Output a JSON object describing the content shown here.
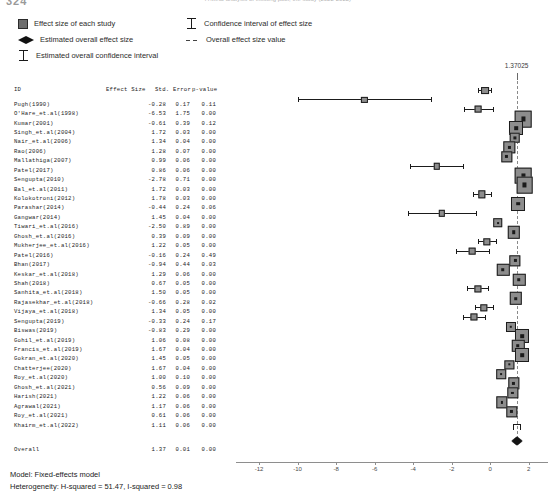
{
  "header": {
    "crop_left": "324",
    "crop_right": "A Meta-analysis of existing pool, the study (2022-2022)"
  },
  "legend": {
    "items_left": [
      {
        "glyph": "gray-square-icon",
        "label": "Effect size of each study"
      },
      {
        "glyph": "black-diamond-icon",
        "label": "Estimated overall effect size"
      },
      {
        "glyph": "error-bar-icon",
        "label": "Estimated overall confidence interval"
      }
    ],
    "items_right": [
      {
        "glyph": "error-bar-icon",
        "label": "Confidence interval of effect size"
      },
      {
        "glyph": "dashed-line-icon",
        "label": "Overall effect size value"
      }
    ]
  },
  "table": {
    "columns": [
      "ID",
      "Effect Size",
      "Std. Error",
      "p-value"
    ],
    "rows": [
      {
        "id": "Pugh(1990)",
        "es": "-0.28",
        "se": "0.17",
        "pv": "0.11"
      },
      {
        "id": "O'Hare_et.al(1998)",
        "es": "-6.53",
        "se": "1.75",
        "pv": "0.00"
      },
      {
        "id": "Kumar(2001)",
        "es": "-0.61",
        "se": "0.39",
        "pv": "0.12"
      },
      {
        "id": "Singh_et.al(2004)",
        "es": "1.72",
        "se": "0.03",
        "pv": "0.00"
      },
      {
        "id": "Nair_et.al(2006)",
        "es": "1.34",
        "se": "0.04",
        "pv": "0.00"
      },
      {
        "id": "Rao(2006)",
        "es": "1.28",
        "se": "0.07",
        "pv": "0.00"
      },
      {
        "id": "Mallathiga(2007)",
        "es": "0.99",
        "se": "0.06",
        "pv": "0.00"
      },
      {
        "id": "Patel(2017)",
        "es": "0.86",
        "se": "0.06",
        "pv": "0.00"
      },
      {
        "id": "Sengupta(2010)",
        "es": "-2.78",
        "se": "0.71",
        "pv": "0.00"
      },
      {
        "id": "Bal_et.al(2011)",
        "es": "1.72",
        "se": "0.03",
        "pv": "0.00"
      },
      {
        "id": "Kolokotroni(2012)",
        "es": "1.78",
        "se": "0.03",
        "pv": "0.00"
      },
      {
        "id": "Parashar(2014)",
        "es": "-0.44",
        "se": "0.24",
        "pv": "0.06"
      },
      {
        "id": "Gangwar(2014)",
        "es": "1.45",
        "se": "0.04",
        "pv": "0.00"
      },
      {
        "id": "Tiwari_et.al(2016)",
        "es": "-2.50",
        "se": "0.89",
        "pv": "0.00"
      },
      {
        "id": "Ghosh_et.al(2016)",
        "es": "0.39",
        "se": "0.09",
        "pv": "0.00"
      },
      {
        "id": "Mukherjee_et.al(2016)",
        "es": "1.22",
        "se": "0.05",
        "pv": "0.00"
      },
      {
        "id": "Patel(2016)",
        "es": "-0.16",
        "se": "0.24",
        "pv": "0.49"
      },
      {
        "id": "Bhan(2017)",
        "es": "-0.94",
        "se": "0.44",
        "pv": "0.03"
      },
      {
        "id": "Keskar_et.al(2018)",
        "es": "1.29",
        "se": "0.06",
        "pv": "0.00"
      },
      {
        "id": "Shah(2018)",
        "es": "0.67",
        "se": "0.05",
        "pv": "0.00"
      },
      {
        "id": "Sanhita_et.al(2018)",
        "es": "1.50",
        "se": "0.05",
        "pv": "0.00"
      },
      {
        "id": "Rajasekhar_et.al(2018)",
        "es": "-0.66",
        "se": "0.28",
        "pv": "0.02"
      },
      {
        "id": "Vijaya_et.al(2018)",
        "es": "1.34",
        "se": "0.05",
        "pv": "0.00"
      },
      {
        "id": "Sengupta(2019)",
        "es": "-0.33",
        "se": "0.24",
        "pv": "0.17"
      },
      {
        "id": "Biswas(2019)",
        "es": "-0.83",
        "se": "0.29",
        "pv": "0.00"
      },
      {
        "id": "Gohil_et.al(2019)",
        "es": "1.06",
        "se": "0.08",
        "pv": "0.00"
      },
      {
        "id": "Francis_et.al(2019)",
        "es": "1.67",
        "se": "0.04",
        "pv": "0.00"
      },
      {
        "id": "Gokran_et.al(2020)",
        "es": "1.45",
        "se": "0.05",
        "pv": "0.00"
      },
      {
        "id": "Chatterjee(2020)",
        "es": "1.67",
        "se": "0.04",
        "pv": "0.00"
      },
      {
        "id": "Roy_et.al(2020)",
        "es": "1.00",
        "se": "0.10",
        "pv": "0.00"
      },
      {
        "id": "Ghosh_et.al(2021)",
        "es": "0.56",
        "se": "0.09",
        "pv": "0.00"
      },
      {
        "id": "Harish(2021)",
        "es": "1.22",
        "se": "0.06",
        "pv": "0.00"
      },
      {
        "id": "Agrawal(2021)",
        "es": "1.17",
        "se": "0.06",
        "pv": "0.00"
      },
      {
        "id": "Roy_et.al(2021)",
        "es": "0.61",
        "se": "0.06",
        "pv": "0.00"
      },
      {
        "id": "Khairm_et.al(2022)",
        "es": "1.11",
        "se": "0.06",
        "pv": "0.00"
      }
    ],
    "overall": {
      "id": "Overall",
      "es": "1.37",
      "se": "0.01",
      "pv": "0.00"
    }
  },
  "plot": {
    "annotation": "1.37025",
    "axis": {
      "ticks": [
        -12,
        -10,
        -8,
        -6,
        -4,
        -2,
        0,
        2
      ],
      "tick_labels": [
        "-12",
        "-10",
        "-8",
        "-6",
        "-4",
        "-2",
        "0",
        "2"
      ],
      "min": -13.2,
      "max": 3.0
    },
    "ref_line_value": 1.37025,
    "colors": {
      "marker_fill": "#8d8d8d",
      "marker_edge": "#1c1c1c",
      "ci_line": "#1b1b1b",
      "ref_line": "#8a8a8a",
      "axis": "#8e8e8e"
    }
  },
  "chart_data": {
    "type": "forest",
    "title": "",
    "xlabel": "",
    "ylabel": "",
    "xlim": [
      -13.2,
      3.0
    ],
    "grid": false,
    "legend_position": "top",
    "ref_line": 1.37025,
    "model": "Fixed-effects model",
    "heterogeneity": {
      "H_squared": 51.47,
      "I_squared": 0.98
    },
    "categories": [
      "Pugh(1990)",
      "O'Hare_et.al(1998)",
      "Kumar(2001)",
      "Singh_et.al(2004)",
      "Nair_et.al(2006)",
      "Rao(2006)",
      "Mallathiga(2007)",
      "Patel(2017)",
      "Sengupta(2010)",
      "Bal_et.al(2011)",
      "Kolokotroni(2012)",
      "Parashar(2014)",
      "Gangwar(2014)",
      "Tiwari_et.al(2016)",
      "Ghosh_et.al(2016)",
      "Mukherjee_et.al(2016)",
      "Patel(2016)",
      "Bhan(2017)",
      "Keskar_et.al(2018)",
      "Shah(2018)",
      "Sanhita_et.al(2018)",
      "Rajasekhar_et.al(2018)",
      "Vijaya_et.al(2018)",
      "Sengupta(2019)",
      "Biswas(2019)",
      "Gohil_et.al(2019)",
      "Francis_et.al(2019)",
      "Gokran_et.al(2020)",
      "Chatterjee(2020)",
      "Roy_et.al(2020)",
      "Ghosh_et.al(2021)",
      "Harish(2021)",
      "Agrawal(2021)",
      "Roy_et.al(2021)",
      "Khairm_et.al(2022)",
      "Overall"
    ],
    "effect_sizes": [
      -0.28,
      -6.53,
      -0.61,
      1.72,
      1.34,
      1.28,
      0.99,
      0.86,
      -2.78,
      1.72,
      1.78,
      -0.44,
      1.45,
      -2.5,
      0.39,
      1.22,
      -0.16,
      -0.94,
      1.29,
      0.67,
      1.5,
      -0.66,
      1.34,
      -0.33,
      -0.83,
      1.06,
      1.67,
      1.45,
      1.67,
      1.0,
      0.56,
      1.22,
      1.17,
      0.61,
      1.11,
      1.37
    ],
    "std_errors": [
      0.17,
      1.75,
      0.39,
      0.03,
      0.04,
      0.07,
      0.06,
      0.06,
      0.71,
      0.03,
      0.03,
      0.24,
      0.04,
      0.89,
      0.09,
      0.05,
      0.24,
      0.44,
      0.06,
      0.05,
      0.05,
      0.28,
      0.05,
      0.24,
      0.29,
      0.08,
      0.04,
      0.05,
      0.04,
      0.1,
      0.09,
      0.06,
      0.06,
      0.06,
      0.06,
      0.01
    ],
    "p_values": [
      0.11,
      0.0,
      0.12,
      0.0,
      0.0,
      0.0,
      0.0,
      0.0,
      0.0,
      0.0,
      0.0,
      0.06,
      0.0,
      0.0,
      0.0,
      0.0,
      0.49,
      0.03,
      0.0,
      0.0,
      0.0,
      0.02,
      0.0,
      0.17,
      0.0,
      0.0,
      0.0,
      0.0,
      0.0,
      0.0,
      0.0,
      0.0,
      0.0,
      0.0,
      0.0,
      0.0
    ]
  },
  "footer": {
    "model_line": "Model: Fixed-effects model",
    "heterogeneity_line": "Heterogeneity: H-squared = 51.47, I-squared = 0.98"
  }
}
